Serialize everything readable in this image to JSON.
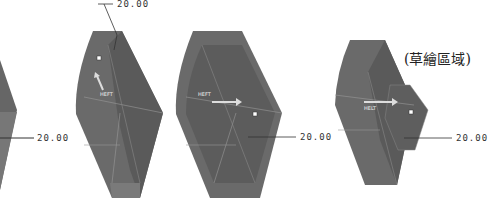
{
  "views": [
    {
      "name": "view-1",
      "dimension": "20.00"
    },
    {
      "name": "view-2",
      "dimension": "20.00",
      "tag": "HEFT"
    },
    {
      "name": "view-3",
      "dimension": "20.00",
      "tag": "HEFT"
    },
    {
      "name": "view-4",
      "dimension": "20.00",
      "tag": "HELT"
    }
  ],
  "sketch_region_label": "(草繪區域)",
  "colors": {
    "solid": "#6e6e6e",
    "solid_dark": "#555555",
    "edge": "#9a9a9a",
    "background": "#ffffff"
  }
}
